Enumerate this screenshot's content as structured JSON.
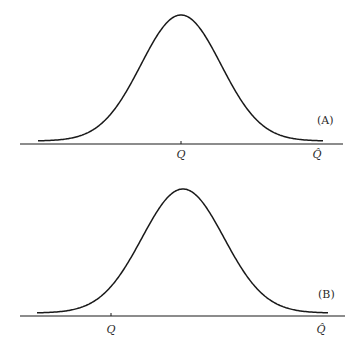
{
  "panels": [
    {
      "id": "A",
      "label": "(A)",
      "axis": {
        "x1": 20,
        "x2": 343,
        "y": 144
      },
      "curve": {
        "start_x": 38,
        "end_x": 323,
        "peak_x": 181,
        "peak_y": 15,
        "base_y": 141,
        "sigma": 40
      },
      "ticks": [
        {
          "name": "q",
          "text": "Q",
          "x": 181,
          "tick": true
        },
        {
          "name": "q-hat",
          "text": "Q̂",
          "x": 317,
          "tick": false
        }
      ],
      "label_pos": {
        "x": 317,
        "y": 124
      },
      "tick_label_y": 158
    },
    {
      "id": "B",
      "label": "(B)",
      "axis": {
        "x1": 20,
        "x2": 345,
        "y": 316
      },
      "curve": {
        "start_x": 37,
        "end_x": 328,
        "peak_x": 183,
        "peak_y": 189,
        "base_y": 313,
        "sigma": 41
      },
      "ticks": [
        {
          "name": "q",
          "text": "Q",
          "x": 111,
          "tick": true
        },
        {
          "name": "q-hat",
          "text": "Q̂",
          "x": 321,
          "tick": false
        }
      ],
      "label_pos": {
        "x": 318,
        "y": 298
      },
      "tick_label_y": 333
    }
  ],
  "colors": {
    "stroke": "#1a1a1a",
    "background": "#ffffff"
  }
}
